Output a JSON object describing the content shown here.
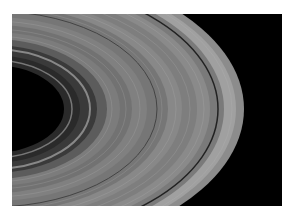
{
  "image": {
    "subject": "Planetary ring system",
    "background_color": "#000000",
    "border_color": "#ffffff",
    "ring_color": "#9a9a9a"
  }
}
